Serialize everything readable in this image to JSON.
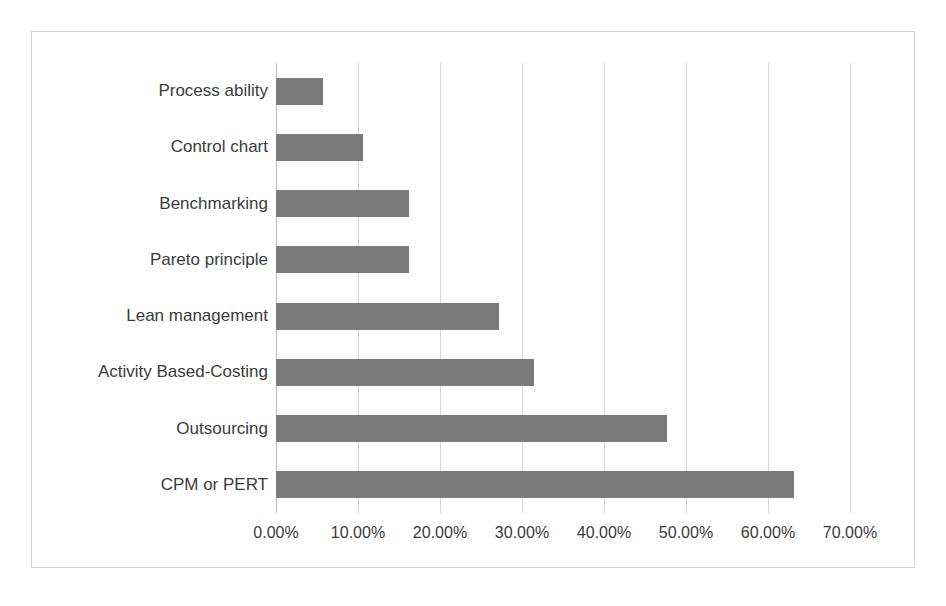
{
  "chart_data": {
    "type": "bar",
    "orientation": "horizontal",
    "title": "",
    "subtitle": "",
    "xlabel": "",
    "ylabel": "",
    "categories": [
      "Process ability",
      "Control chart",
      "Benchmarking",
      "Pareto principle",
      "Lean management",
      "Activity Based-Costing",
      "Outsourcing",
      "CPM or PERT"
    ],
    "values": [
      5.7,
      10.6,
      16.2,
      16.2,
      27.2,
      31.5,
      47.7,
      63.2
    ],
    "value_unit": "%",
    "xlim": [
      0,
      70
    ],
    "xticks": [
      0,
      10,
      20,
      30,
      40,
      50,
      60,
      70
    ],
    "xtick_labels": [
      "0.00%",
      "10.00%",
      "20.00%",
      "30.00%",
      "40.00%",
      "50.00%",
      "60.00%",
      "70.00%"
    ],
    "grid": {
      "vertical": true,
      "horizontal": false
    },
    "legend": {
      "visible": false,
      "position": "none",
      "entries": []
    },
    "series": [
      {
        "name": "Usage",
        "color": "#7b7b7b",
        "values": [
          5.7,
          10.6,
          16.2,
          16.2,
          27.2,
          31.5,
          47.7,
          63.2
        ]
      }
    ]
  },
  "colors": {
    "bar": "#7b7b7b",
    "gridline": "#d9d9d9",
    "axis": "#bfbfbf",
    "frame_border": "#d4d4d4",
    "background": "#ffffff",
    "text": "#3b3b3b"
  }
}
